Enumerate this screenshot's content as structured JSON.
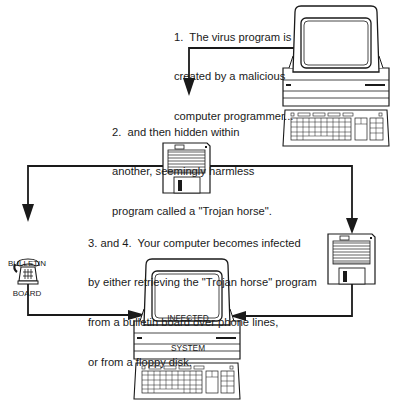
{
  "diagram": {
    "type": "flow",
    "steps": [
      {
        "id": "step1",
        "lines": [
          "1.  The virus program is",
          "created by a malicious",
          "computer programmer..."
        ]
      },
      {
        "id": "step2",
        "lines": [
          "2.  and then hidden within",
          "another, seemingly harmless",
          "program called a \"Trojan horse\"."
        ]
      },
      {
        "id": "step34",
        "lines": [
          "3. and 4.  Your computer becomes infected",
          "by either retrieving the \"Trojan horse\" program",
          "from a bulletin board over phone lines,",
          "or from a floppy disk."
        ]
      }
    ],
    "nodes": {
      "programmer_computer": {
        "icon": "computer-icon"
      },
      "trojan_disk": {
        "icon": "floppy-disk-icon"
      },
      "bulletin_board": {
        "label_lines": [
          "BULLETIN",
          "BOARD"
        ],
        "icon": "telephone-icon"
      },
      "floppy_disk": {
        "icon": "floppy-disk-icon"
      },
      "infected_computer": {
        "screen_lines": [
          "INFECTED",
          "SYSTEM"
        ],
        "icon": "computer-icon"
      }
    },
    "edges": [
      {
        "from": "programmer_computer",
        "to": "trojan_disk"
      },
      {
        "from": "trojan_disk",
        "to": "bulletin_board"
      },
      {
        "from": "trojan_disk",
        "to": "floppy_disk"
      },
      {
        "from": "bulletin_board",
        "to": "infected_computer"
      },
      {
        "from": "floppy_disk",
        "to": "infected_computer"
      }
    ],
    "colors": {
      "ink": "#1a1a1a",
      "background": "#ffffff"
    }
  }
}
